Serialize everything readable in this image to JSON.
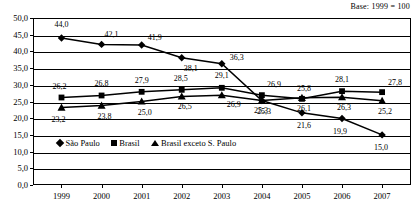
{
  "note": "Base: 1999 = 100",
  "legend": {
    "position": "inside-bottom-left",
    "entries": [
      {
        "label": "São Paulo",
        "marker": "diamond-marker-icon"
      },
      {
        "label": "Brasil",
        "marker": "square-marker-icon"
      },
      {
        "label": "Brasil exceto S. Paulo",
        "marker": "triangle-marker-icon"
      }
    ]
  },
  "axes": {
    "y_ticks": [
      "0,0",
      "5,0",
      "10,0",
      "15,0",
      "20,0",
      "25,0",
      "30,0",
      "35,0",
      "40,0",
      "45,0",
      "50,0"
    ],
    "x_ticks": [
      "1999",
      "2000",
      "2001",
      "2002",
      "2003",
      "2004",
      "2005",
      "2006",
      "2007"
    ]
  },
  "chart_data": {
    "type": "line",
    "title": "",
    "subtitle": "Base: 1999 = 100",
    "xlabel": "",
    "ylabel": "",
    "ylim": [
      0,
      50
    ],
    "ytick_step": 5,
    "grid": true,
    "legend_position": "inside bottom-left",
    "categories": [
      "1999",
      "2000",
      "2001",
      "2002",
      "2003",
      "2004",
      "2005",
      "2006",
      "2007"
    ],
    "series": [
      {
        "name": "São Paulo",
        "marker": "diamond",
        "values": [
          44.0,
          42.1,
          41.9,
          38.1,
          36.3,
          25.3,
          21.6,
          19.9,
          15.0
        ],
        "labels": [
          "44,0",
          "42,1",
          "41,9",
          "38,1",
          "36,3",
          "25,3",
          "21,6",
          "19,9",
          "15,0"
        ]
      },
      {
        "name": "Brasil",
        "marker": "square",
        "values": [
          26.2,
          26.8,
          27.9,
          28.5,
          29.1,
          26.9,
          25.8,
          28.1,
          27.8
        ],
        "labels": [
          "26,2",
          "26,8",
          "27,9",
          "28,5",
          "29,1",
          "26,9",
          "25,8",
          "28,1",
          "27,8"
        ]
      },
      {
        "name": "Brasil exceto S. Paulo",
        "marker": "triangle",
        "values": [
          23.2,
          23.8,
          25.0,
          26.5,
          26.9,
          25.3,
          26.1,
          26.3,
          25.2
        ],
        "labels": [
          "23,2",
          "23,8",
          "25,0",
          "26,5",
          "26,9",
          "25,3",
          "26,1",
          "26,3",
          "25,2"
        ]
      }
    ]
  },
  "colors": {
    "line": "#000000",
    "grid": "#000000",
    "background": "#ffffff"
  }
}
